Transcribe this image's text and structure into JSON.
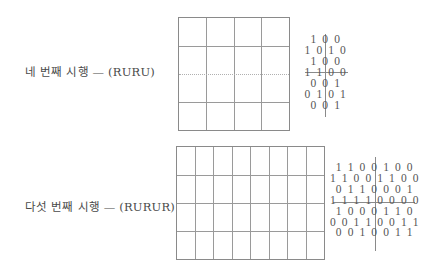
{
  "trials": [
    {
      "label": "네 번째 시행 — (RURU)",
      "grid": {
        "columns": 4,
        "rows": 4
      },
      "pattern": {
        "rows": [
          "1 0 0",
          "1 0 1 0",
          "1 0 0",
          "1 1 0 0",
          "0 0 1",
          "0 1 0 1",
          "0 0 1"
        ],
        "struck_row_index": 3
      }
    },
    {
      "label": "다섯 번째 시행 — (RURUR)",
      "grid": {
        "columns": 8,
        "rows": 4
      },
      "pattern": {
        "rows": [
          "1 1 0 0 1 0 0",
          "1 1 0 0 1 1 0 0",
          "0 1 1 0 0 0 1",
          "1 1 1 1 0 0 0 0",
          "1 0 0 0 1 1 0",
          "0 0 1 1 0 0 1 1",
          "0 0 1 0 0 1 1"
        ],
        "struck_row_index": 3
      }
    }
  ]
}
